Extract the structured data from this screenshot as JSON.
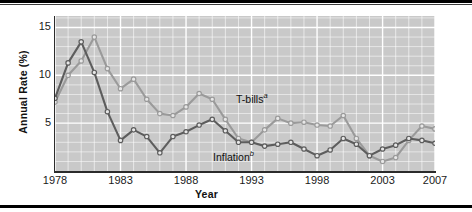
{
  "chart_data": {
    "type": "line",
    "title": "",
    "xlabel": "Year",
    "ylabel": "Annual Rate (%)",
    "xlim": [
      1978,
      2007
    ],
    "ylim": [
      0,
      16.2
    ],
    "yticks": [
      5,
      10,
      15
    ],
    "ytick_labels": [
      "5",
      "10",
      "15"
    ],
    "xticks": [
      1978,
      1983,
      1988,
      1993,
      1998,
      2003,
      2007
    ],
    "xtick_labels": [
      "1978",
      "1983",
      "1988",
      "1993",
      "1998",
      "2003",
      "2007"
    ],
    "grid": true,
    "grid_color": "#ffffff",
    "plot_background": "#c9c9c9",
    "legend_position": "inline-annotation",
    "x": [
      1978,
      1979,
      1980,
      1981,
      1982,
      1983,
      1984,
      1985,
      1986,
      1987,
      1988,
      1989,
      1990,
      1991,
      1992,
      1993,
      1994,
      1995,
      1996,
      1997,
      1998,
      1999,
      2000,
      2001,
      2002,
      2003,
      2004,
      2005,
      2006,
      2007
    ],
    "series": [
      {
        "name": "T-bills",
        "note_label": "T-bills",
        "note_superscript": "a",
        "color": "#9a9a9a",
        "marker": "circle-open",
        "values": [
          7.2,
          10.0,
          11.5,
          14.0,
          10.7,
          8.6,
          9.6,
          7.5,
          6.0,
          5.8,
          6.7,
          8.1,
          7.5,
          5.4,
          3.4,
          3.0,
          4.3,
          5.5,
          5.0,
          5.1,
          4.8,
          4.7,
          5.8,
          3.4,
          1.6,
          1.0,
          1.4,
          3.2,
          4.7,
          4.4
        ]
      },
      {
        "name": "Inflation",
        "note_label": "Inflation",
        "note_superscript": "b",
        "color": "#5d5d5d",
        "marker": "circle-open",
        "values": [
          7.6,
          11.3,
          13.5,
          10.3,
          6.2,
          3.2,
          4.3,
          3.6,
          1.9,
          3.6,
          4.1,
          4.8,
          5.4,
          4.2,
          3.0,
          3.0,
          2.6,
          2.8,
          3.0,
          2.3,
          1.6,
          2.2,
          3.4,
          2.8,
          1.6,
          2.3,
          2.7,
          3.4,
          3.2,
          2.9
        ]
      }
    ]
  }
}
